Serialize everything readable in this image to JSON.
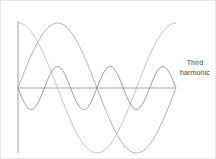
{
  "figure": {
    "title": "",
    "background_color": "#ffffff",
    "border_color": "#e8e8e8",
    "width": 216,
    "height": 159
  },
  "annotation": {
    "line1": "Third",
    "line2": "harmonic",
    "color": "#444444"
  },
  "axes": {
    "x_axis_color": "#8a8a8a",
    "y_axis_color": "#8a8a8a",
    "origin_x": 17,
    "origin_y": 87,
    "x_axis_end": 174,
    "y_axis_top": 20,
    "y_axis_bottom": 152
  },
  "chart_data": {
    "type": "line",
    "title": "",
    "xlabel": "",
    "ylabel": "",
    "grid": false,
    "legend_position": "right",
    "xlim": [
      0,
      3
    ],
    "ylim": [
      -1.1,
      1.1
    ],
    "annotations": [
      {
        "text": "Third harmonic",
        "x": 3.15,
        "y": 0.45
      }
    ],
    "series": [
      {
        "name": "Fundamental (sine)",
        "form": "sin",
        "amplitude": 1.0,
        "cycles": 3,
        "phase_deg": 0,
        "color": "#8a8a8a",
        "x": [
          0,
          0.25,
          0.5,
          0.75,
          1,
          1.25,
          1.5,
          1.75,
          2,
          2.25,
          2.5,
          2.75,
          3
        ],
        "values": [
          0,
          1,
          0,
          -1,
          0,
          1,
          0,
          -1,
          0,
          1,
          0,
          -1,
          0
        ]
      },
      {
        "name": "Fundamental (cosine, phase shifted)",
        "form": "cos",
        "amplitude": 1.0,
        "cycles": 3,
        "phase_deg": 90,
        "color": "#a8a8a8",
        "x": [
          0,
          0.25,
          0.5,
          0.75,
          1,
          1.25,
          1.5,
          1.75,
          2,
          2.25,
          2.5,
          2.75,
          3
        ],
        "values": [
          1,
          0,
          -1,
          0,
          1,
          0,
          -1,
          0,
          1,
          0,
          -1,
          0,
          1
        ]
      },
      {
        "name": "Third harmonic",
        "form": "sin",
        "amplitude": 0.33,
        "cycles": 9,
        "phase_deg": 180,
        "color": "#6f6f6f",
        "x": [
          0,
          0.083,
          0.167,
          0.25,
          0.333,
          0.417,
          0.5,
          0.583,
          0.667,
          0.75,
          0.833,
          0.917,
          1
        ],
        "values": [
          0,
          -0.33,
          0,
          0.33,
          0,
          -0.33,
          0,
          0.33,
          0,
          -0.33,
          0,
          0.33,
          0
        ]
      }
    ]
  }
}
